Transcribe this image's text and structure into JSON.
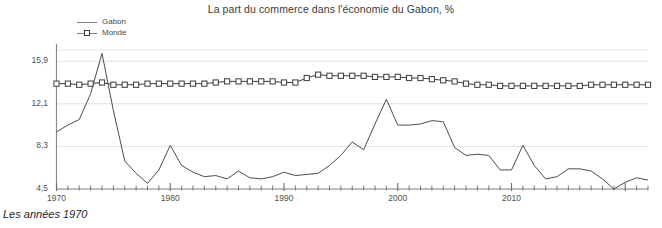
{
  "chart_data": {
    "type": "line",
    "title": "La part du commerce dans l'économie du Gabon, %",
    "caption": "Les années 1970",
    "xlabel": "",
    "ylabel": "",
    "xlim": [
      1970,
      2022
    ],
    "ylim": [
      4.5,
      15.9
    ],
    "grid": true,
    "legend_position": "top-left",
    "ytick_labels": [
      "15,9",
      "12,1",
      "8,3",
      "4,5"
    ],
    "ytick_values": [
      15.9,
      12.1,
      8.3,
      4.5
    ],
    "xtick_labels": [
      "1970",
      "1980",
      "1990",
      "2000",
      "2010"
    ],
    "xtick_values": [
      1970,
      1980,
      1990,
      2000,
      2010
    ],
    "x": [
      1970,
      1971,
      1972,
      1973,
      1974,
      1975,
      1976,
      1977,
      1978,
      1979,
      1980,
      1981,
      1982,
      1983,
      1984,
      1985,
      1986,
      1987,
      1988,
      1989,
      1990,
      1991,
      1992,
      1993,
      1994,
      1995,
      1996,
      1997,
      1998,
      1999,
      2000,
      2001,
      2002,
      2003,
      2004,
      2005,
      2006,
      2007,
      2008,
      2009,
      2010,
      2011,
      2012,
      2013,
      2014,
      2015,
      2016,
      2017,
      2018,
      2019,
      2020,
      2021,
      2022
    ],
    "series": [
      {
        "name": "Gabon",
        "marker": "none",
        "color": "#4d4d4d",
        "values": [
          9.6,
          10.2,
          10.7,
          13.0,
          16.6,
          11.5,
          7.0,
          5.9,
          5.0,
          6.2,
          8.4,
          6.6,
          6.0,
          5.6,
          5.7,
          5.4,
          6.1,
          5.5,
          5.4,
          5.6,
          6.0,
          5.7,
          5.8,
          5.9,
          6.6,
          7.5,
          8.7,
          8.0,
          10.3,
          12.5,
          10.2,
          10.2,
          10.3,
          10.6,
          10.5,
          8.2,
          7.5,
          7.6,
          7.5,
          6.2,
          6.2,
          8.4,
          6.6,
          5.4,
          5.6,
          6.3,
          6.3,
          6.1,
          5.4,
          4.5,
          5.1,
          5.5,
          5.3
        ]
      },
      {
        "name": "Monde",
        "marker": "square",
        "color": "#3c3c3c",
        "values": [
          13.9,
          13.9,
          13.8,
          13.9,
          14.0,
          13.8,
          13.8,
          13.8,
          13.9,
          13.9,
          13.9,
          13.9,
          13.9,
          13.9,
          14.0,
          14.1,
          14.1,
          14.1,
          14.1,
          14.1,
          14.0,
          14.0,
          14.4,
          14.7,
          14.6,
          14.6,
          14.6,
          14.6,
          14.5,
          14.5,
          14.5,
          14.4,
          14.4,
          14.3,
          14.2,
          14.1,
          13.9,
          13.8,
          13.8,
          13.7,
          13.7,
          13.7,
          13.7,
          13.7,
          13.7,
          13.7,
          13.7,
          13.8,
          13.8,
          13.8,
          13.8,
          13.8,
          13.8
        ]
      }
    ]
  },
  "legend": {
    "items": [
      {
        "label": "Gabon",
        "marker": "none"
      },
      {
        "label": "Monde",
        "marker": "square"
      }
    ]
  }
}
